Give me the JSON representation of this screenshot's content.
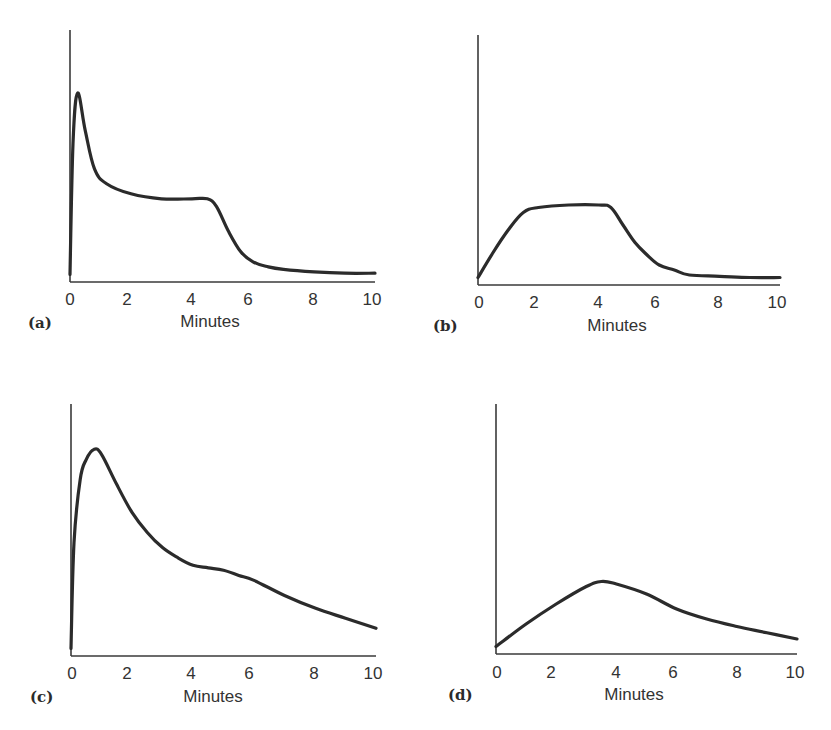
{
  "chart_data": [
    {
      "type": "line",
      "panel_label": "(a)",
      "title": "",
      "xlabel": "Minutes",
      "ylabel": "",
      "xlim": [
        0,
        10
      ],
      "ylim": [
        0,
        1
      ],
      "xticks": [
        0,
        2,
        4,
        6,
        8,
        10
      ],
      "yticks": [],
      "grid": false,
      "legend": null,
      "series": [
        {
          "name": "curve-a",
          "x": [
            0,
            0.1,
            0.25,
            0.5,
            0.8,
            1.2,
            2,
            3,
            4,
            4.5,
            4.8,
            5.2,
            5.6,
            6,
            6.5,
            7,
            8,
            9,
            10
          ],
          "y": [
            0.03,
            0.55,
            0.75,
            0.6,
            0.45,
            0.39,
            0.35,
            0.33,
            0.33,
            0.33,
            0.3,
            0.2,
            0.12,
            0.08,
            0.06,
            0.05,
            0.04,
            0.035,
            0.035
          ]
        }
      ]
    },
    {
      "type": "line",
      "panel_label": "(b)",
      "title": "",
      "xlabel": "Minutes",
      "ylabel": "",
      "xlim": [
        0,
        10
      ],
      "ylim": [
        0,
        1
      ],
      "xticks": [
        0,
        2,
        4,
        6,
        8,
        10
      ],
      "yticks": [],
      "grid": false,
      "legend": null,
      "series": [
        {
          "name": "curve-b",
          "x": [
            0,
            0.5,
            1,
            1.5,
            2,
            3,
            4,
            4.4,
            4.8,
            5.2,
            5.6,
            6,
            6.5,
            7,
            8,
            9,
            10
          ],
          "y": [
            0.03,
            0.13,
            0.22,
            0.29,
            0.31,
            0.32,
            0.32,
            0.31,
            0.24,
            0.17,
            0.12,
            0.08,
            0.06,
            0.04,
            0.035,
            0.03,
            0.03
          ]
        }
      ]
    },
    {
      "type": "line",
      "panel_label": "(c)",
      "title": "",
      "xlabel": "Minutes",
      "ylabel": "",
      "xlim": [
        0,
        10
      ],
      "ylim": [
        0,
        1
      ],
      "xticks": [
        0,
        2,
        4,
        6,
        8,
        10
      ],
      "yticks": [],
      "grid": false,
      "legend": null,
      "series": [
        {
          "name": "curve-c",
          "x": [
            0,
            0.1,
            0.3,
            0.5,
            0.75,
            1,
            1.5,
            2,
            2.5,
            3,
            3.5,
            4,
            4.5,
            5,
            5.5,
            6,
            7,
            8,
            9,
            10
          ],
          "y": [
            0.03,
            0.45,
            0.7,
            0.78,
            0.82,
            0.8,
            0.68,
            0.57,
            0.49,
            0.43,
            0.39,
            0.36,
            0.35,
            0.34,
            0.32,
            0.3,
            0.24,
            0.19,
            0.15,
            0.11
          ]
        }
      ]
    },
    {
      "type": "line",
      "panel_label": "(d)",
      "title": "",
      "xlabel": "Minutes",
      "ylabel": "",
      "xlim": [
        0,
        10
      ],
      "ylim": [
        0,
        1
      ],
      "xticks": [
        0,
        2,
        4,
        6,
        8,
        10
      ],
      "yticks": [],
      "grid": false,
      "legend": null,
      "series": [
        {
          "name": "curve-d",
          "x": [
            0,
            1,
            2,
            3,
            3.5,
            4,
            5,
            6,
            7,
            8,
            9,
            10
          ],
          "y": [
            0.03,
            0.12,
            0.2,
            0.27,
            0.29,
            0.28,
            0.24,
            0.18,
            0.14,
            0.11,
            0.085,
            0.06
          ]
        }
      ]
    }
  ],
  "panels": [
    {
      "label": "(a)",
      "xlabel": "Minutes",
      "ticks": [
        "0",
        "2",
        "4",
        "6",
        "8",
        "10"
      ]
    },
    {
      "label": "(b)",
      "xlabel": "Minutes",
      "ticks": [
        "0",
        "2",
        "4",
        "6",
        "8",
        "10"
      ]
    },
    {
      "label": "(c)",
      "xlabel": "Minutes",
      "ticks": [
        "0",
        "2",
        "4",
        "6",
        "8",
        "10"
      ]
    },
    {
      "label": "(d)",
      "xlabel": "Minutes",
      "ticks": [
        "0",
        "2",
        "4",
        "6",
        "8",
        "10"
      ]
    }
  ],
  "colors": {
    "line": "#2b2b2b",
    "axis": "#3a3a3a",
    "text": "#333333",
    "background": "#ffffff"
  }
}
